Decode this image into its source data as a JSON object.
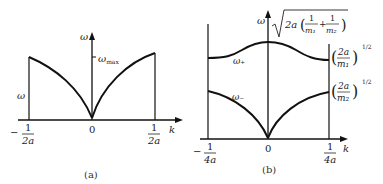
{
  "panel_a": {
    "caption": "(a)",
    "y_axis_label": "ω",
    "x_axis_label": "k",
    "curve_label": "ω",
    "max_label": "ω",
    "max_sub": "max",
    "ticks": {
      "left_num": "1",
      "left_den": "2a",
      "left_sign": "−",
      "zero": "0",
      "right_num": "1",
      "right_den": "2a"
    }
  },
  "panel_b": {
    "caption": "(b)",
    "y_axis_label": "ω",
    "x_axis_label": "k",
    "upper_branch": "ω₊",
    "lower_branch": "ω₋",
    "top_value": "2a ( 1/m₁ + 1/m₂ )",
    "top_two_a": "2a",
    "top_one1": "1",
    "top_m1": "m₁",
    "top_plus": "+",
    "top_one2": "1",
    "top_m2": "m₂",
    "right_upper_num": "2a",
    "right_upper_den": "m₁",
    "right_lower_num": "2a",
    "right_lower_den": "m₂",
    "exponent": "1/2",
    "ticks": {
      "left_num": "1",
      "left_den": "4a",
      "left_sign": "−",
      "zero": "0",
      "right_num": "1",
      "right_den": "4a"
    }
  }
}
